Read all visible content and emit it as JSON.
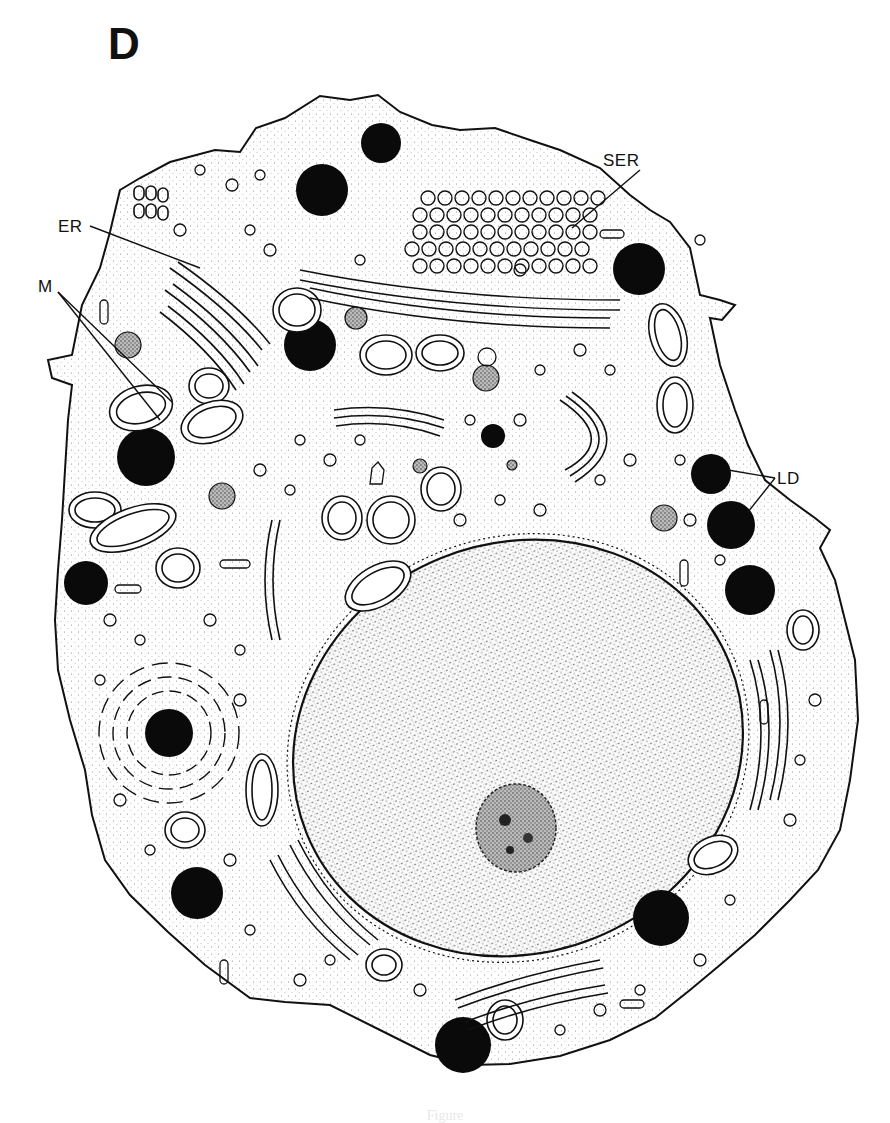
{
  "figure": {
    "panel_label": "D",
    "ink_color": "#111111",
    "background_color": "#ffffff",
    "labels": [
      {
        "id": "ER",
        "text": "ER",
        "x": 58,
        "y": 218,
        "pointer": [
          [
            90,
            226
          ],
          [
            200,
            268
          ]
        ]
      },
      {
        "id": "SER",
        "text": "SER",
        "x": 603,
        "y": 152,
        "pointer": [
          [
            640,
            170
          ],
          [
            572,
            228
          ]
        ]
      },
      {
        "id": "M",
        "text": "M",
        "x": 38,
        "y": 278,
        "pointer": [
          [
            58,
            292
          ],
          [
            172,
            402
          ],
          [
            58,
            292
          ],
          [
            160,
            420
          ]
        ]
      },
      {
        "id": "LD",
        "text": "LD",
        "x": 777,
        "y": 470,
        "pointer": [
          [
            775,
            478
          ],
          [
            728,
            470
          ],
          [
            775,
            478
          ],
          [
            748,
            512
          ]
        ]
      }
    ]
  },
  "caption": {
    "text": "Figure"
  }
}
